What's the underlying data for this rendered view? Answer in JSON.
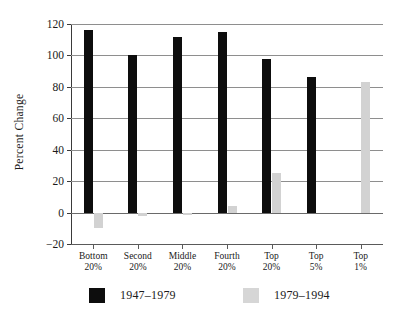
{
  "chart_data": {
    "type": "bar",
    "title": "",
    "subtitle": "",
    "xlabel": "",
    "ylabel": "Percent Change",
    "ylim": [
      -20,
      120
    ],
    "yticks": [
      -20,
      0,
      20,
      40,
      60,
      80,
      100,
      120
    ],
    "ytick_labels": [
      "−20",
      "0",
      "20",
      "40",
      "60",
      "80",
      "100",
      "120"
    ],
    "grid": true,
    "grid_axis": "y",
    "legend_position": "bottom",
    "categories": [
      "Bottom\n20%",
      "Second\n20%",
      "Middle\n20%",
      "Fourth\n20%",
      "Top\n20%",
      "Top\n5%",
      "Top\n1%"
    ],
    "category_lines": [
      [
        "Bottom",
        "20%"
      ],
      [
        "Second",
        "20%"
      ],
      [
        "Middle",
        "20%"
      ],
      [
        "Fourth",
        "20%"
      ],
      [
        "Top",
        "20%"
      ],
      [
        "Top",
        "5%"
      ],
      [
        "Top",
        "1%"
      ]
    ],
    "series": [
      {
        "name": "1947–1979",
        "color": "#0d0d0d",
        "values": [
          116,
          100,
          112,
          115,
          98,
          86,
          null
        ]
      },
      {
        "name": "1979–1994",
        "color": "#d2d2d2",
        "values": [
          -10,
          -2,
          -1.5,
          4,
          25,
          null,
          83
        ]
      }
    ]
  },
  "legend": {
    "items": [
      {
        "label": "1947–1979",
        "color": "#0d0d0d"
      },
      {
        "label": "1979–1994",
        "color": "#d6d6d6"
      }
    ]
  },
  "axis": {
    "y_title": "Percent Change"
  }
}
